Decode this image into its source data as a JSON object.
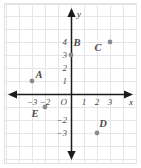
{
  "chart_data": {
    "type": "scatter",
    "title": "",
    "xlabel": "x",
    "ylabel": "y",
    "xlim": [
      -4,
      4
    ],
    "ylim": [
      -4,
      5
    ],
    "grid": true,
    "legend": "none",
    "x_ticks": [
      {
        "value": -3,
        "label": "−3"
      },
      {
        "value": -2,
        "label": "−2"
      },
      {
        "value": 1,
        "label": "1"
      },
      {
        "value": 2,
        "label": "2"
      },
      {
        "value": 3,
        "label": "3"
      }
    ],
    "y_ticks": [
      {
        "value": 4,
        "label": "4"
      },
      {
        "value": 3,
        "label": "3"
      },
      {
        "value": 2,
        "label": "2"
      },
      {
        "value": 1,
        "label": "1"
      },
      {
        "value": -2,
        "label": "−2"
      },
      {
        "value": -3,
        "label": "−3"
      }
    ],
    "origin_label": "O",
    "points": [
      {
        "name": "A",
        "x": -3,
        "y": 1,
        "label": "A",
        "label_dx": 7,
        "label_dy": -3
      },
      {
        "name": "B",
        "x": 0,
        "y": 3,
        "label": "B",
        "label_dx": 6,
        "label_dy": -9
      },
      {
        "name": "C",
        "x": 3,
        "y": 4,
        "label": "C",
        "label_dx": -12,
        "label_dy": 9
      },
      {
        "name": "D",
        "x": 2,
        "y": -3,
        "label": "D",
        "label_dx": 6,
        "label_dy": -6
      },
      {
        "name": "E",
        "x": -2,
        "y": -1,
        "label": "E",
        "label_dx": -10,
        "label_dy": 10
      }
    ]
  },
  "style": {
    "point_color": "#8c8c90",
    "axis_color": "#1a1a1a",
    "grid_color": "#e6e6e8",
    "background": "#ffffff"
  }
}
